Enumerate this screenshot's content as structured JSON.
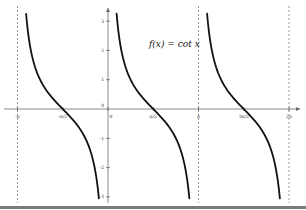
{
  "chart_data": {
    "type": "line",
    "title": "f(x) = cot x",
    "function": "cot x",
    "xlabel": "",
    "ylabel": "",
    "xlim": [
      -3.4,
      6.6
    ],
    "ylim": [
      -3.1,
      3.3
    ],
    "grid": false,
    "legend": null,
    "x_ticks": [
      {
        "value": -3.14159,
        "label": "-π"
      },
      {
        "value": -1.5708,
        "label": "-π/2"
      },
      {
        "value": 0,
        "label": "0"
      },
      {
        "value": 1.5708,
        "label": "π/2"
      },
      {
        "value": 3.14159,
        "label": "π"
      },
      {
        "value": 4.71239,
        "label": "3π/2"
      },
      {
        "value": 6.28319,
        "label": "2π"
      }
    ],
    "y_ticks": [
      {
        "value": 3,
        "label": "3"
      },
      {
        "value": 2,
        "label": "2"
      },
      {
        "value": 1,
        "label": "1"
      },
      {
        "value": -1,
        "label": "-1"
      },
      {
        "value": -2,
        "label": "-2"
      },
      {
        "value": -3,
        "label": "-3"
      }
    ],
    "asymptotes": [
      -3.14159,
      3.14159,
      6.28319
    ],
    "series": [
      {
        "name": "cot x branch (-π, 0)",
        "x_range": [
          -3.14159,
          0
        ],
        "zero_at": -1.5708
      },
      {
        "name": "cot x branch (0, π)",
        "x_range": [
          0,
          3.14159
        ],
        "zero_at": 1.5708
      },
      {
        "name": "cot x branch (π, 2π)",
        "x_range": [
          3.14159,
          6.28319
        ],
        "zero_at": 4.71239
      }
    ],
    "annotations": [
      {
        "text": "f(x) = cot x",
        "x": 2.1,
        "y": 2.1
      }
    ],
    "colors": {
      "curve": "#111111",
      "axis": "#888888",
      "asymptote": "#999999",
      "bottom_bar": "#7a7a7a"
    }
  },
  "formula": "f(x) = cot x"
}
